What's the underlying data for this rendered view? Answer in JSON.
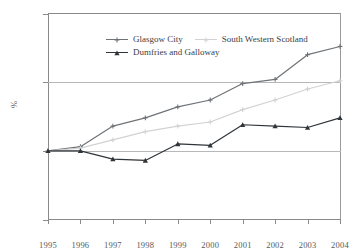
{
  "chart_data": {
    "type": "line",
    "title": "",
    "subtitle": "",
    "xlabel": "",
    "ylabel": "%",
    "categories": [
      "1995",
      "1996",
      "1997",
      "1998",
      "1999",
      "2000",
      "2001",
      "2002",
      "2003",
      "2004"
    ],
    "x": [
      1995,
      1996,
      1997,
      1998,
      1999,
      2000,
      2001,
      2002,
      2003,
      2004
    ],
    "ylim": [
      50,
      200
    ],
    "yticks": [
      50,
      100,
      150,
      200
    ],
    "ytick_labels": [
      "50",
      "100",
      "150",
      "200"
    ],
    "grid": "horizontal gridlines at 100 and 150",
    "legend_position": "top-left inside plot area",
    "series": [
      {
        "name": "Glasgow City",
        "color": "#6f7377",
        "marker": "plus",
        "values": [
          100,
          103,
          118,
          124,
          132,
          137,
          149,
          152,
          170,
          176
        ]
      },
      {
        "name": "South Western Scotland",
        "color": "#d2d2d2",
        "marker": "plus",
        "values": [
          100,
          102,
          108,
          114,
          118,
          121,
          130,
          137,
          145,
          151
        ]
      },
      {
        "name": "Dumfries and Galloway",
        "color": "#2f3438",
        "marker": "triangle",
        "values": [
          100,
          100,
          94,
          93,
          105,
          104,
          119,
          118,
          117,
          124
        ]
      }
    ]
  },
  "axes": {
    "y_title": "%",
    "y_tick_labels": [
      "200",
      "150",
      "100",
      "50"
    ],
    "x_tick_labels": [
      "1995",
      "1996",
      "1997",
      "1998",
      "1999",
      "2000",
      "2001",
      "2002",
      "2003",
      "2004"
    ]
  },
  "legend": {
    "entries": [
      {
        "label": "Glasgow City"
      },
      {
        "label": "South Western Scotland"
      },
      {
        "label": "Dumfries and Galloway"
      }
    ]
  },
  "colors": {
    "glasgow": "#6f7377",
    "south_western_scotland": "#d2d2d2",
    "dumfries_and_galloway": "#2f3438",
    "axis": "#8a8a8a",
    "grid": "#b8b8b8",
    "text": "#55595c"
  }
}
